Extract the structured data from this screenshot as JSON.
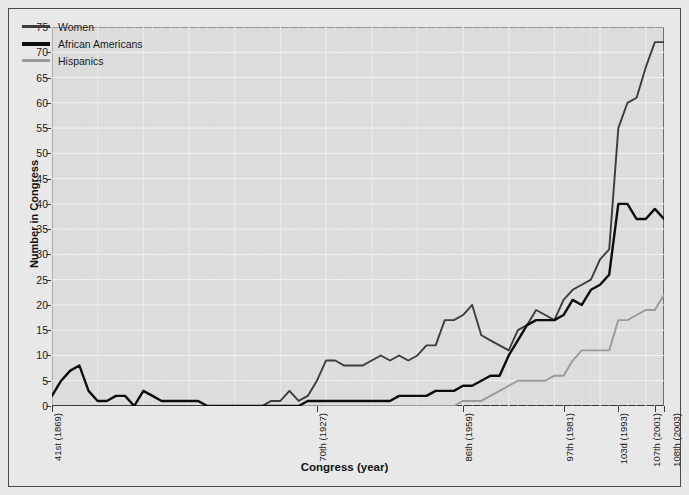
{
  "chart_data": {
    "type": "line",
    "title": "",
    "xlabel": "Congress (year)",
    "ylabel": "Number in Congress",
    "ylim": [
      0,
      75
    ],
    "ytick_step": 5,
    "yticks": [
      0,
      5,
      10,
      15,
      20,
      25,
      30,
      35,
      40,
      45,
      50,
      55,
      60,
      65,
      70,
      75
    ],
    "grid": true,
    "legend_position": "top-left",
    "xtick_labels": [
      "41st (1869)",
      "70th (1927)",
      "86th (1959)",
      "97th (1981)",
      "103d (1993)",
      "107th (2001)",
      "108th (2003)"
    ],
    "xtick_congress": [
      41,
      70,
      86,
      97,
      103,
      107,
      108
    ],
    "x_congress_range": [
      41,
      108
    ],
    "colors": {
      "women": "#3d3d3d",
      "african_americans": "#0d0d0d",
      "hispanics": "#9a9a9a",
      "plot_background": "#dcdcdc",
      "figure_background": "#e8e8e8",
      "gridline": "#f2f2f2",
      "axis": "#3a3a3a"
    },
    "series": [
      {
        "name": "Women",
        "color": "#3d3d3d",
        "x": [
          41,
          42,
          43,
          44,
          45,
          46,
          47,
          48,
          49,
          50,
          51,
          52,
          53,
          54,
          55,
          56,
          57,
          58,
          59,
          60,
          61,
          62,
          63,
          64,
          65,
          66,
          67,
          68,
          69,
          70,
          71,
          72,
          73,
          74,
          75,
          76,
          77,
          78,
          79,
          80,
          81,
          82,
          83,
          84,
          85,
          86,
          87,
          88,
          89,
          90,
          91,
          92,
          93,
          94,
          95,
          96,
          97,
          98,
          99,
          100,
          101,
          102,
          103,
          104,
          105,
          106,
          107,
          108
        ],
        "values": [
          0,
          0,
          0,
          0,
          0,
          0,
          0,
          0,
          0,
          0,
          0,
          0,
          0,
          0,
          0,
          0,
          0,
          0,
          0,
          0,
          0,
          0,
          0,
          0,
          1,
          1,
          3,
          1,
          2,
          5,
          9,
          9,
          8,
          8,
          8,
          9,
          10,
          9,
          10,
          9,
          10,
          12,
          12,
          17,
          17,
          18,
          20,
          14,
          13,
          12,
          11,
          15,
          16,
          19,
          18,
          17,
          21,
          23,
          24,
          25,
          29,
          31,
          55,
          60,
          61,
          67,
          72,
          72
        ],
        "notes": "Number of women in Congress by Congress number"
      },
      {
        "name": "African Americans",
        "color": "#0d0d0d",
        "x": [
          41,
          42,
          43,
          44,
          45,
          46,
          47,
          48,
          49,
          50,
          51,
          52,
          53,
          54,
          55,
          56,
          57,
          58,
          59,
          60,
          61,
          62,
          63,
          64,
          65,
          66,
          67,
          68,
          69,
          70,
          71,
          72,
          73,
          74,
          75,
          76,
          77,
          78,
          79,
          80,
          81,
          82,
          83,
          84,
          85,
          86,
          87,
          88,
          89,
          90,
          91,
          92,
          93,
          94,
          95,
          96,
          97,
          98,
          99,
          100,
          101,
          102,
          103,
          104,
          105,
          106,
          107,
          108
        ],
        "values": [
          2,
          5,
          7,
          8,
          3,
          1,
          1,
          2,
          2,
          0,
          3,
          2,
          1,
          1,
          1,
          1,
          1,
          0,
          0,
          0,
          0,
          0,
          0,
          0,
          0,
          0,
          0,
          0,
          1,
          1,
          1,
          1,
          1,
          1,
          1,
          1,
          1,
          1,
          2,
          2,
          2,
          2,
          3,
          3,
          3,
          4,
          4,
          5,
          6,
          6,
          10,
          13,
          16,
          17,
          17,
          17,
          18,
          21,
          20,
          23,
          24,
          26,
          40,
          40,
          37,
          37,
          39,
          37
        ],
        "notes": "Number of African Americans in Congress by Congress number"
      },
      {
        "name": "Hispanics",
        "color": "#9a9a9a",
        "x": [
          41,
          42,
          43,
          44,
          45,
          46,
          47,
          48,
          49,
          50,
          51,
          52,
          53,
          54,
          55,
          56,
          57,
          58,
          59,
          60,
          61,
          62,
          63,
          64,
          65,
          66,
          67,
          68,
          69,
          70,
          71,
          72,
          73,
          74,
          75,
          76,
          77,
          78,
          79,
          80,
          81,
          82,
          83,
          84,
          85,
          86,
          87,
          88,
          89,
          90,
          91,
          92,
          93,
          94,
          95,
          96,
          97,
          98,
          99,
          100,
          101,
          102,
          103,
          104,
          105,
          106,
          107,
          108
        ],
        "values": [
          0,
          0,
          0,
          0,
          0,
          0,
          0,
          0,
          0,
          0,
          0,
          0,
          0,
          0,
          0,
          0,
          0,
          0,
          0,
          0,
          0,
          0,
          0,
          0,
          0,
          0,
          0,
          0,
          0,
          0,
          0,
          0,
          0,
          0,
          0,
          0,
          0,
          0,
          0,
          0,
          0,
          0,
          0,
          0,
          0,
          1,
          1,
          1,
          2,
          3,
          4,
          5,
          5,
          5,
          5,
          6,
          6,
          9,
          11,
          11,
          11,
          11,
          17,
          17,
          18,
          19,
          19,
          22
        ],
        "notes": "Number of Hispanics in Congress by Congress number"
      }
    ]
  },
  "legend": {
    "items": [
      {
        "label": "Women",
        "color": "#3d3d3d",
        "width": 3
      },
      {
        "label": "African Americans",
        "color": "#0d0d0d",
        "width": 4
      },
      {
        "label": "Hispanics",
        "color": "#9a9a9a",
        "width": 3
      }
    ]
  },
  "axis_titles": {
    "x": "Congress (year)",
    "y": "Number in Congress"
  }
}
